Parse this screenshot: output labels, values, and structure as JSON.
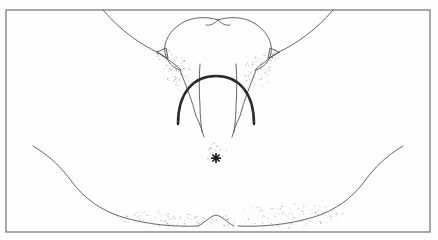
{
  "figure": {
    "domain_kind": "line-drawing",
    "title": "Anatomical line drawing of perineum with crowning",
    "background_color": "#fefefe",
    "ink_color": "#4a4a4a",
    "bold_ink_color": "#2b2b2b",
    "stipple_color": "#8c8c8c",
    "frame": {
      "name": "illustration-border",
      "x": 6,
      "y": 10,
      "width": 424,
      "height": 222,
      "stroke": "#6e6e6e",
      "stroke_width": 1.2,
      "fill": "none"
    },
    "strokes": {
      "left_groin_diagonal": "M 103 10 C 120 30 140 44 157 52",
      "right_groin_diagonal": "M 333 10 C 316 30 296 44 279 52",
      "heart_outline": "M 218 20 C 206 16 192 17 182 23 C 170 30 163 42 165 53 C 167 62 173 68 180 70 C 186 86 192 100 196 116 C 200 124 202 130 204 137 M 218 20 C 230 16 244 17 254 23 C 266 30 273 42 271 53 C 269 62 263 68 256 70 C 250 86 244 100 240 116 C 236 124 234 130 232 137",
      "heart_cleft": "M 218 20 C 214 24 210 26 206 25 M 218 20 C 222 24 226 26 230 25",
      "left_fold_triangle": "M 157 52 L 166 48 L 168 58 Z",
      "right_fold_triangle": "M 279 52 L 270 48 L 268 58 Z",
      "left_fold_tail": "M 157 52 C 166 58 175 64 181 70",
      "right_fold_tail": "M 279 52 C 270 58 261 64 255 70",
      "inner_line_left": "M 200 64 C 199 78 199 92 200 106 C 200 116 201 124 202 132",
      "inner_line_right": "M 236 64 C 237 78 237 92 236 106 C 236 116 235 124 234 132",
      "crowning_arc": "M 178 124 C 178 92 194 76 216 76 C 238 76 254 92 254 124",
      "left_thigh": "M 33 146 C 50 156 62 168 72 182 C 84 198 100 210 122 217 C 148 225 176 227 198 226",
      "right_thigh": "M 403 146 C 386 156 374 168 364 182 C 352 198 336 210 314 217 C 288 225 260 227 238 226",
      "perineal_bump": "M 198 226 C 206 222 210 216 216 215 C 222 216 226 222 234 226"
    },
    "markers": {
      "asterisk": {
        "name": "anus-asterisk-marker",
        "cx": 216,
        "cy": 158,
        "radius": 4.5,
        "color": "#1a1a1a",
        "ray_count": 8
      }
    },
    "stipple_regions": [
      {
        "name": "left-inner-shading",
        "cx": 178,
        "cy": 72,
        "rx": 14,
        "ry": 16,
        "count": 70
      },
      {
        "name": "right-inner-shading",
        "cx": 258,
        "cy": 72,
        "rx": 14,
        "ry": 16,
        "count": 70
      },
      {
        "name": "left-fold-shading",
        "cx": 163,
        "cy": 55,
        "rx": 9,
        "ry": 6,
        "count": 30
      },
      {
        "name": "right-fold-shading",
        "cx": 273,
        "cy": 55,
        "rx": 9,
        "ry": 6,
        "count": 30
      },
      {
        "name": "left-thigh-shading",
        "cx": 160,
        "cy": 219,
        "rx": 45,
        "ry": 8,
        "count": 90
      },
      {
        "name": "right-thigh-shading",
        "cx": 290,
        "cy": 216,
        "rx": 55,
        "ry": 12,
        "count": 110
      },
      {
        "name": "center-perineum-shading",
        "cx": 216,
        "cy": 152,
        "rx": 12,
        "ry": 10,
        "count": 28
      },
      {
        "name": "lower-midline-shading",
        "cx": 216,
        "cy": 221,
        "rx": 22,
        "ry": 6,
        "count": 35
      }
    ]
  }
}
